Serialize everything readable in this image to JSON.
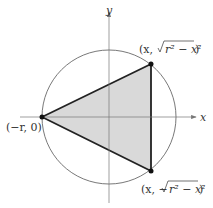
{
  "diagram": {
    "axes": {
      "x_label": "x",
      "y_label": "y"
    },
    "points": {
      "left": "(−r, 0)",
      "upper_prefix": "(x, ",
      "upper_radicand": "r² − x²",
      "upper_suffix": ")",
      "lower_prefix": "(x, −",
      "lower_radicand": "r² − x²",
      "lower_suffix": ")"
    },
    "colors": {
      "fill": "#d9d9d9",
      "stroke": "#222222",
      "circle": "#555555"
    }
  }
}
